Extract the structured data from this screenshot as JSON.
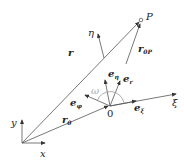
{
  "labels": {
    "P": "P",
    "eta": "η",
    "r": "r",
    "r0P_main": "r",
    "r0P_sub": "0P",
    "e_eta_main": "e",
    "e_eta_sub": "η",
    "e_r_main": "e",
    "e_r_sub": "r",
    "omega": "ω",
    "e_phi_main": "e",
    "e_phi_sub": "φ",
    "zero": "0",
    "e_xi_main": "e",
    "e_xi_sub": "ξ",
    "xi": "ξ",
    "y": "y",
    "r0_main": "r",
    "r0_sub": "0",
    "x": "x"
  }
}
